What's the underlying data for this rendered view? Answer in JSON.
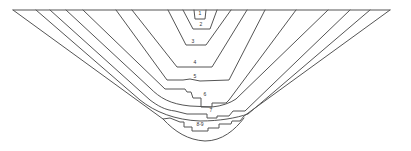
{
  "diagram": {
    "type": "section-profile",
    "colors": {
      "line": "#555555",
      "label": "#333333",
      "background": "#ffffff"
    },
    "layers": [
      {
        "id": "1",
        "label": "1"
      },
      {
        "id": "2",
        "label": "2"
      },
      {
        "id": "3",
        "label": "3"
      },
      {
        "id": "4",
        "label": "4"
      },
      {
        "id": "5",
        "label": "5"
      },
      {
        "id": "6",
        "label": "6"
      },
      {
        "id": "7",
        "label": "7"
      },
      {
        "id": "8-9",
        "label": "8-9"
      }
    ]
  }
}
